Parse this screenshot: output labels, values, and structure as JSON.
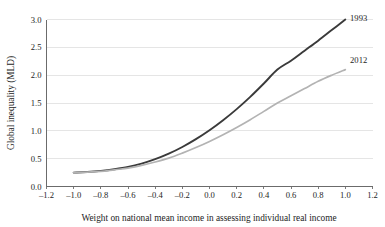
{
  "chart_data": {
    "type": "line",
    "title": "",
    "xlabel": "Weight on national mean income in assessing individual real income",
    "ylabel": "Global inequality (MLD)",
    "xlim": [
      -1.2,
      1.2
    ],
    "ylim": [
      0.0,
      3.0
    ],
    "grid": "horizontal",
    "legend_position": "inline-right-end-of-line",
    "x_ticks": [
      "–1.2",
      "–1.0",
      "–0.8",
      "–0.6",
      "–0.4",
      "–0.2",
      "0.0",
      "0.2",
      "0.4",
      "0.6",
      "0.8",
      "1.0",
      "1.2"
    ],
    "x_tick_values": [
      -1.2,
      -1.0,
      -0.8,
      -0.6,
      -0.4,
      -0.2,
      0.0,
      0.2,
      0.4,
      0.6,
      0.8,
      1.0,
      1.2
    ],
    "y_ticks": [
      "0.0",
      "0.5",
      "1.0",
      "1.5",
      "2.0",
      "2.5",
      "3.0"
    ],
    "y_tick_values": [
      0.0,
      0.5,
      1.0,
      1.5,
      2.0,
      2.5,
      3.0
    ],
    "x": [
      -1.0,
      -0.9,
      -0.8,
      -0.7,
      -0.6,
      -0.5,
      -0.4,
      -0.3,
      -0.2,
      -0.1,
      0.0,
      0.1,
      0.2,
      0.3,
      0.4,
      0.5,
      0.6,
      0.7,
      0.8,
      0.9,
      1.0
    ],
    "series": [
      {
        "name": "1993",
        "color": "#3a3a3a",
        "width": 1.9,
        "label_x": 1.02,
        "label_y": 3.02,
        "values": [
          0.25,
          0.26,
          0.28,
          0.31,
          0.35,
          0.41,
          0.49,
          0.59,
          0.71,
          0.85,
          1.01,
          1.19,
          1.39,
          1.61,
          1.85,
          2.1,
          2.26,
          2.44,
          2.62,
          2.81,
          3.0
        ]
      },
      {
        "name": "2012",
        "color": "#b3b3b3",
        "width": 1.7,
        "label_x": 1.02,
        "label_y": 2.28,
        "values": [
          0.25,
          0.26,
          0.27,
          0.3,
          0.33,
          0.38,
          0.44,
          0.51,
          0.6,
          0.7,
          0.81,
          0.93,
          1.06,
          1.2,
          1.35,
          1.5,
          1.63,
          1.76,
          1.89,
          2.0,
          2.1
        ]
      }
    ]
  }
}
